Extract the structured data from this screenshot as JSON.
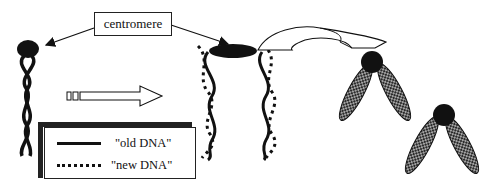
{
  "diagram": {
    "label": "centromere",
    "legend": {
      "items": [
        {
          "label": "\"old DNA\"",
          "style": "solid"
        },
        {
          "label": "\"new DNA\"",
          "style": "dotted"
        }
      ]
    },
    "nodes": [
      {
        "id": "unreplicated-chromosome",
        "description": "single double-helix with centromere"
      },
      {
        "id": "replicated-chromosome",
        "description": "two helices (old + new DNA) joined at centromere"
      },
      {
        "id": "condensed-chromosome-1",
        "description": "condensed chromatid pair"
      },
      {
        "id": "condensed-chromosome-2",
        "description": "condensed chromatid pair"
      }
    ],
    "edges": [
      {
        "from": "centromere-label",
        "to": "unreplicated-chromosome centromere",
        "type": "arrow"
      },
      {
        "from": "centromere-label",
        "to": "replicated-chromosome centromere",
        "type": "arrow"
      },
      {
        "from": "unreplicated-chromosome",
        "to": "replicated-chromosome",
        "type": "block-arrow"
      },
      {
        "from": "replicated-chromosome",
        "to": "condensed-chromosome-1",
        "type": "curved-block-arrow"
      }
    ],
    "colors": {
      "ink": "#111111",
      "background": "#ffffff"
    }
  }
}
